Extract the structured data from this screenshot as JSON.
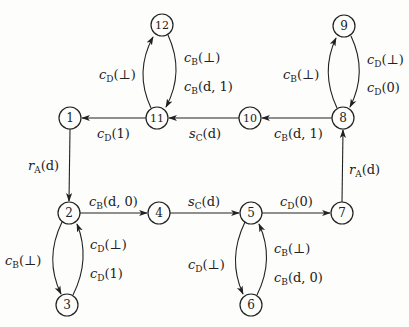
{
  "nodes": [
    {
      "id": "1",
      "x": 70,
      "y": 118
    },
    {
      "id": "2",
      "x": 69,
      "y": 213
    },
    {
      "id": "3",
      "x": 67,
      "y": 305
    },
    {
      "id": "4",
      "x": 159,
      "y": 213
    },
    {
      "id": "5",
      "x": 251,
      "y": 213
    },
    {
      "id": "6",
      "x": 251,
      "y": 305
    },
    {
      "id": "7",
      "x": 342,
      "y": 213
    },
    {
      "id": "8",
      "x": 343,
      "y": 118
    },
    {
      "id": "9",
      "x": 344,
      "y": 26
    },
    {
      "id": "10",
      "x": 250,
      "y": 118
    },
    {
      "id": "11",
      "x": 157,
      "y": 118
    },
    {
      "id": "12",
      "x": 162,
      "y": 25
    }
  ],
  "edges": [
    {
      "from": "1",
      "to": "2",
      "label": {
        "base": "r",
        "sub": "A",
        "arg": "(d)"
      }
    },
    {
      "from": "2",
      "to": "4",
      "label": {
        "base": "c",
        "sub": "B",
        "arg": "(d, 0)"
      }
    },
    {
      "from": "4",
      "to": "5",
      "label": {
        "base": "s",
        "sub": "C",
        "arg": "(d)"
      }
    },
    {
      "from": "5",
      "to": "7",
      "label": {
        "base": "c",
        "sub": "D",
        "arg": "(0)"
      }
    },
    {
      "from": "7",
      "to": "8",
      "label": {
        "base": "r",
        "sub": "A",
        "arg": "(d)"
      }
    },
    {
      "from": "8",
      "to": "10",
      "label": {
        "base": "c",
        "sub": "B",
        "arg": "(d, 1)"
      }
    },
    {
      "from": "10",
      "to": "11",
      "label": {
        "base": "s",
        "sub": "C",
        "arg": "(d)"
      }
    },
    {
      "from": "11",
      "to": "1",
      "label": {
        "base": "c",
        "sub": "D",
        "arg": "(1)"
      }
    },
    {
      "from": "2",
      "to": "3",
      "label": {
        "base": "c",
        "sub": "B",
        "arg": "(⊥)"
      }
    },
    {
      "from": "3",
      "to": "2",
      "labels": [
        {
          "base": "c",
          "sub": "D",
          "arg": "(⊥)"
        },
        {
          "base": "c",
          "sub": "D",
          "arg": "(1)"
        }
      ]
    },
    {
      "from": "5",
      "to": "6",
      "label": {
        "base": "c",
        "sub": "D",
        "arg": "(⊥)"
      }
    },
    {
      "from": "6",
      "to": "5",
      "labels": [
        {
          "base": "c",
          "sub": "B",
          "arg": "(⊥)"
        },
        {
          "base": "c",
          "sub": "B",
          "arg": "(d, 0)"
        }
      ]
    },
    {
      "from": "8",
      "to": "9",
      "label": {
        "base": "c",
        "sub": "B",
        "arg": "(⊥)"
      }
    },
    {
      "from": "9",
      "to": "8",
      "labels": [
        {
          "base": "c",
          "sub": "D",
          "arg": "(⊥)"
        },
        {
          "base": "c",
          "sub": "D",
          "arg": "(0)"
        }
      ]
    },
    {
      "from": "11",
      "to": "12",
      "label": {
        "base": "c",
        "sub": "D",
        "arg": "(⊥)"
      }
    },
    {
      "from": "12",
      "to": "11",
      "labels": [
        {
          "base": "c",
          "sub": "B",
          "arg": "(⊥)"
        },
        {
          "base": "c",
          "sub": "B",
          "arg": "(d, 1)"
        }
      ]
    }
  ],
  "text": {
    "n1": "1",
    "n2": "2",
    "n3": "3",
    "n4": "4",
    "n5": "5",
    "n6": "6",
    "n7": "7",
    "n8": "8",
    "n9": "9",
    "n10": "10",
    "n11": "11",
    "n12": "12",
    "e1_2": {
      "b": "r",
      "s": "A",
      "a": "(d)"
    },
    "e2_4": {
      "b": "c",
      "s": "B",
      "a": "(d, 0)"
    },
    "e4_5": {
      "b": "s",
      "s": "C",
      "a": "(d)"
    },
    "e5_7": {
      "b": "c",
      "s": "D",
      "a": "(0)"
    },
    "e7_8": {
      "b": "r",
      "s": "A",
      "a": "(d)"
    },
    "e8_10": {
      "b": "c",
      "s": "B",
      "a": "(d, 1)"
    },
    "e10_11": {
      "b": "s",
      "s": "C",
      "a": "(d)"
    },
    "e11_1": {
      "b": "c",
      "s": "D",
      "a": "(1)"
    },
    "e2_3": {
      "b": "c",
      "s": "B",
      "a": "(⊥)"
    },
    "e3_2a": {
      "b": "c",
      "s": "D",
      "a": "(⊥)"
    },
    "e3_2b": {
      "b": "c",
      "s": "D",
      "a": "(1)"
    },
    "e5_6": {
      "b": "c",
      "s": "D",
      "a": "(⊥)"
    },
    "e6_5a": {
      "b": "c",
      "s": "B",
      "a": "(⊥)"
    },
    "e6_5b": {
      "b": "c",
      "s": "B",
      "a": "(d, 0)"
    },
    "e8_9": {
      "b": "c",
      "s": "B",
      "a": "(⊥)"
    },
    "e9_8a": {
      "b": "c",
      "s": "D",
      "a": "(⊥)"
    },
    "e9_8b": {
      "b": "c",
      "s": "D",
      "a": "(0)"
    },
    "e11_12": {
      "b": "c",
      "s": "D",
      "a": "(⊥)"
    },
    "e12_11a": {
      "b": "c",
      "s": "B",
      "a": "(⊥)"
    },
    "e12_11b": {
      "b": "c",
      "s": "B",
      "a": "(d, 1)"
    }
  }
}
